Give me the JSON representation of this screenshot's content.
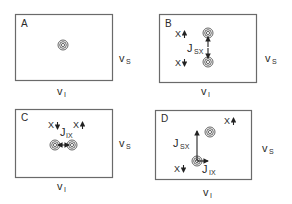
{
  "figure": {
    "type": "2D NMR spectrum schematic panels",
    "axes": {
      "horizontal": "v",
      "horizontal_sub": "I",
      "vertical": "v",
      "vertical_sub": "S"
    },
    "panels": [
      {
        "letter": "A",
        "peaks": 1,
        "labels": []
      },
      {
        "letter": "B",
        "peaks": 2,
        "labels": [
          {
            "text": "X",
            "spin": "up"
          },
          {
            "text": "X",
            "spin": "down"
          },
          {
            "text": "J",
            "sub": "SX"
          }
        ],
        "coupling": "vertical J_SX splitting"
      },
      {
        "letter": "C",
        "peaks": 2,
        "labels": [
          {
            "text": "X",
            "spin": "down"
          },
          {
            "text": "X",
            "spin": "up"
          },
          {
            "text": "J",
            "sub": "IX"
          }
        ],
        "coupling": "horizontal J_IX splitting"
      },
      {
        "letter": "D",
        "peaks": 2,
        "labels": [
          {
            "text": "X",
            "spin": "up"
          },
          {
            "text": "X",
            "spin": "down"
          },
          {
            "text": "J",
            "sub": "SX"
          },
          {
            "text": "J",
            "sub": "IX"
          }
        ],
        "coupling": "diagonal displacement with J_SX (vertical) and J_IX (horizontal) components"
      }
    ],
    "colors": {
      "frame": "#6a6a6a",
      "ink": "#222222"
    }
  }
}
